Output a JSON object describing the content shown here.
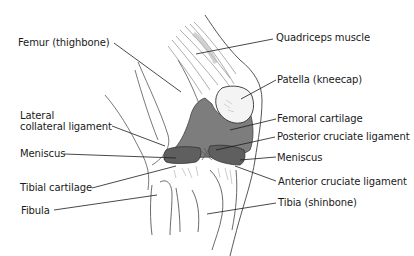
{
  "diagram": {
    "colors": {
      "background": "#ffffff",
      "outline": "#3a3a3a",
      "cartilage_fill": "#7a7a7a",
      "meniscus_fill": "#5e5e5e",
      "leader_line": "#1a1a1a",
      "label_text": "#1a1a1a"
    },
    "labels": {
      "femur": "Femur (thighbone)",
      "quadriceps": "Quadriceps muscle",
      "patella": "Patella (kneecap)",
      "lateral_collateral_line1": "Lateral",
      "lateral_collateral_line2": "collateral ligament",
      "femoral_cartilage": "Femoral cartilage",
      "posterior_cruciate": "Posterior cruciate ligament",
      "meniscus_left": "Meniscus",
      "meniscus_right": "Meniscus",
      "tibial_cartilage": "Tibial cartilage",
      "anterior_cruciate": "Anterior cruciate ligament",
      "fibula": "Fibula",
      "tibia": "Tibia (shinbone)"
    }
  }
}
